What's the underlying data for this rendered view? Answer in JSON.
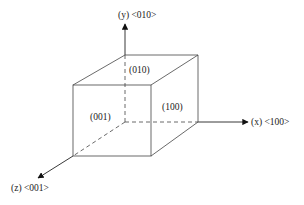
{
  "diagram": {
    "type": "crystal-cube-axes",
    "stroke_color": "#3a3a3a",
    "axes": [
      {
        "id": "y",
        "label": "(y) <010>"
      },
      {
        "id": "x",
        "label": "(x) <100>"
      },
      {
        "id": "z",
        "label": "(z) <001>"
      }
    ],
    "faces": [
      {
        "id": "top",
        "label": "(010)"
      },
      {
        "id": "right",
        "label": "(100)"
      },
      {
        "id": "front",
        "label": "(001)"
      }
    ]
  }
}
